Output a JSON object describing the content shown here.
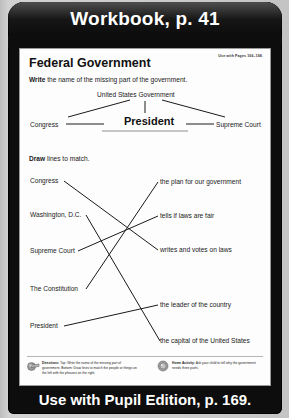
{
  "banner": {
    "top_title": "Workbook, p. 41",
    "bottom_title": "Use with Pupil Edition, p. 169."
  },
  "worksheet": {
    "title": "Federal Government",
    "use_with": "Use with Pages 166–168.",
    "instruction_top_bold": "Write",
    "instruction_top_rest": " the name of the missing part of the government.",
    "instruction_bottom_bold": "Draw",
    "instruction_bottom_rest": " lines to match."
  },
  "diagram": {
    "root": "United States Government",
    "left_branch": "Congress",
    "center_branch": "President",
    "right_branch": "Supreme Court"
  },
  "matching": {
    "left_items": [
      "Congress",
      "Washington, D.C.",
      "Supreme Court",
      "The Constitution",
      "President"
    ],
    "right_items": [
      "the plan for our government",
      "tells if laws are fair",
      "writes and votes on laws",
      "the leader of the country",
      "the capital of the United States"
    ]
  },
  "notes": {
    "directions_label": "Directions:",
    "directions_text": " Top: Write the name of the missing part of government. Bottom: Draw lines to match the people or things on the left with the phrases on the right.",
    "home_label": "Home Activity:",
    "home_text": " Ask your child to tell why the government needs three parts."
  },
  "colors": {
    "frame": "#0d0d0d",
    "page": "#fdfdfd",
    "text": "#1a1a1a",
    "outer": "#c4c4c4"
  }
}
